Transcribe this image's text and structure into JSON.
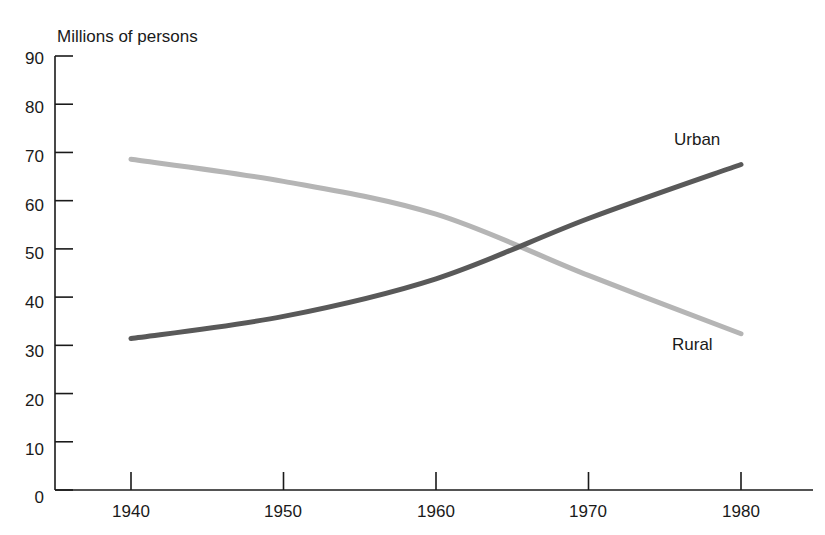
{
  "chart_data": {
    "type": "line",
    "title": "",
    "subtitle": "",
    "ylabel": "Millions of persons",
    "xlabel": "",
    "ylim": [
      0,
      90
    ],
    "xlim": [
      1936,
      1988
    ],
    "grid": false,
    "legend_position": "inline-annotations",
    "y_ticks": [
      "90",
      "80",
      "70",
      "60",
      "50",
      "40",
      "30",
      "20",
      "10",
      "0"
    ],
    "y_tick_values": [
      90,
      80,
      70,
      60,
      50,
      40,
      30,
      20,
      10,
      0
    ],
    "x_ticks": [
      "1940",
      "1950",
      "1960",
      "1970",
      "1980"
    ],
    "x_tick_values": [
      1940,
      1950,
      1960,
      1970,
      1980
    ],
    "x": [
      1940,
      1950,
      1960,
      1970,
      1980
    ],
    "series": [
      {
        "name": "Urban",
        "color": "#595959",
        "values": [
          31.4,
          36.0,
          43.8,
          56.3,
          67.5
        ],
        "label_text": "Urban"
      },
      {
        "name": "Rural",
        "color": "#b5b5b5",
        "values": [
          68.6,
          64.0,
          57.2,
          44.5,
          32.4
        ],
        "label_text": "Rural"
      }
    ],
    "annotations": [
      {
        "text": "Urban",
        "x": 1973,
        "y": 72
      },
      {
        "text": "Rural",
        "x": 1972,
        "y": 35
      }
    ],
    "crossing_point": {
      "x": 1964.5,
      "y": 50.0
    }
  },
  "axes": {
    "axis_color": "#1a1a1a",
    "tick_direction": "inward"
  }
}
